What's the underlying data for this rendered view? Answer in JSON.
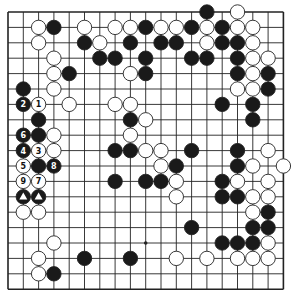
{
  "board": {
    "size": 19,
    "origin_x": 8,
    "origin_y": 12,
    "spacing_x": 15.3,
    "spacing_y": 15.4,
    "stone_radius": 7.2,
    "colors": {
      "black": "#1a1a1a",
      "white": "#ffffff",
      "line": "#222222",
      "stroke": "#222222"
    },
    "star_points": [
      {
        "col": 9,
        "row": 15
      }
    ]
  },
  "stones": [
    {
      "col": 13,
      "row": 0,
      "color": "black"
    },
    {
      "col": 15,
      "row": 0,
      "color": "white"
    },
    {
      "col": 2,
      "row": 1,
      "color": "white"
    },
    {
      "col": 3,
      "row": 1,
      "color": "black"
    },
    {
      "col": 5,
      "row": 1,
      "color": "white"
    },
    {
      "col": 7,
      "row": 1,
      "color": "white"
    },
    {
      "col": 8,
      "row": 1,
      "color": "white"
    },
    {
      "col": 9,
      "row": 1,
      "color": "black"
    },
    {
      "col": 10,
      "row": 1,
      "color": "white"
    },
    {
      "col": 11,
      "row": 1,
      "color": "white"
    },
    {
      "col": 12,
      "row": 1,
      "color": "black"
    },
    {
      "col": 13,
      "row": 1,
      "color": "white"
    },
    {
      "col": 14,
      "row": 1,
      "color": "black"
    },
    {
      "col": 15,
      "row": 1,
      "color": "white"
    },
    {
      "col": 16,
      "row": 1,
      "color": "white"
    },
    {
      "col": 2,
      "row": 2,
      "color": "white"
    },
    {
      "col": 5,
      "row": 2,
      "color": "black"
    },
    {
      "col": 6,
      "row": 2,
      "color": "white"
    },
    {
      "col": 8,
      "row": 2,
      "color": "black"
    },
    {
      "col": 10,
      "row": 2,
      "color": "black"
    },
    {
      "col": 11,
      "row": 2,
      "color": "black"
    },
    {
      "col": 13,
      "row": 2,
      "color": "white"
    },
    {
      "col": 14,
      "row": 2,
      "color": "black"
    },
    {
      "col": 15,
      "row": 2,
      "color": "black"
    },
    {
      "col": 16,
      "row": 2,
      "color": "white"
    },
    {
      "col": 3,
      "row": 3,
      "color": "white"
    },
    {
      "col": 6,
      "row": 3,
      "color": "black"
    },
    {
      "col": 7,
      "row": 3,
      "color": "black"
    },
    {
      "col": 9,
      "row": 3,
      "color": "black"
    },
    {
      "col": 12,
      "row": 3,
      "color": "black"
    },
    {
      "col": 13,
      "row": 3,
      "color": "black"
    },
    {
      "col": 15,
      "row": 3,
      "color": "black"
    },
    {
      "col": 16,
      "row": 3,
      "color": "white"
    },
    {
      "col": 17,
      "row": 3,
      "color": "white"
    },
    {
      "col": 3,
      "row": 4,
      "color": "white"
    },
    {
      "col": 4,
      "row": 4,
      "color": "black"
    },
    {
      "col": 8,
      "row": 4,
      "color": "white"
    },
    {
      "col": 9,
      "row": 4,
      "color": "black"
    },
    {
      "col": 15,
      "row": 4,
      "color": "black"
    },
    {
      "col": 16,
      "row": 4,
      "color": "white"
    },
    {
      "col": 17,
      "row": 4,
      "color": "black"
    },
    {
      "col": 1,
      "row": 5,
      "color": "black"
    },
    {
      "col": 3,
      "row": 5,
      "color": "white"
    },
    {
      "col": 15,
      "row": 5,
      "color": "white"
    },
    {
      "col": 16,
      "row": 5,
      "color": "white"
    },
    {
      "col": 17,
      "row": 5,
      "color": "black"
    },
    {
      "col": 1,
      "row": 6,
      "color": "black",
      "label": "2"
    },
    {
      "col": 2,
      "row": 6,
      "color": "white",
      "label": "1"
    },
    {
      "col": 4,
      "row": 6,
      "color": "white"
    },
    {
      "col": 7,
      "row": 6,
      "color": "white"
    },
    {
      "col": 8,
      "row": 6,
      "color": "white"
    },
    {
      "col": 14,
      "row": 6,
      "color": "black"
    },
    {
      "col": 16,
      "row": 6,
      "color": "black"
    },
    {
      "col": 2,
      "row": 7,
      "color": "black"
    },
    {
      "col": 8,
      "row": 7,
      "color": "black"
    },
    {
      "col": 9,
      "row": 7,
      "color": "white"
    },
    {
      "col": 16,
      "row": 7,
      "color": "black"
    },
    {
      "col": 1,
      "row": 8,
      "color": "black",
      "label": "6"
    },
    {
      "col": 2,
      "row": 8,
      "color": "black"
    },
    {
      "col": 3,
      "row": 8,
      "color": "white"
    },
    {
      "col": 8,
      "row": 8,
      "color": "white"
    },
    {
      "col": 1,
      "row": 9,
      "color": "black",
      "label": "4"
    },
    {
      "col": 2,
      "row": 9,
      "color": "white",
      "label": "3"
    },
    {
      "col": 3,
      "row": 9,
      "color": "white"
    },
    {
      "col": 7,
      "row": 9,
      "color": "black"
    },
    {
      "col": 8,
      "row": 9,
      "color": "black"
    },
    {
      "col": 9,
      "row": 9,
      "color": "white"
    },
    {
      "col": 10,
      "row": 9,
      "color": "white"
    },
    {
      "col": 12,
      "row": 9,
      "color": "black"
    },
    {
      "col": 15,
      "row": 9,
      "color": "black"
    },
    {
      "col": 17,
      "row": 9,
      "color": "white"
    },
    {
      "col": 1,
      "row": 10,
      "color": "white",
      "label": "5"
    },
    {
      "col": 2,
      "row": 10,
      "color": "black"
    },
    {
      "col": 3,
      "row": 10,
      "color": "black",
      "label": "8"
    },
    {
      "col": 10,
      "row": 10,
      "color": "white"
    },
    {
      "col": 11,
      "row": 10,
      "color": "black"
    },
    {
      "col": 15,
      "row": 10,
      "color": "black"
    },
    {
      "col": 16,
      "row": 10,
      "color": "white"
    },
    {
      "col": 18,
      "row": 10,
      "color": "white"
    },
    {
      "col": 1,
      "row": 11,
      "color": "white",
      "label": "9"
    },
    {
      "col": 2,
      "row": 11,
      "color": "white",
      "label": "7"
    },
    {
      "col": 7,
      "row": 11,
      "color": "black"
    },
    {
      "col": 9,
      "row": 11,
      "color": "black"
    },
    {
      "col": 10,
      "row": 11,
      "color": "black"
    },
    {
      "col": 11,
      "row": 11,
      "color": "white"
    },
    {
      "col": 14,
      "row": 11,
      "color": "black"
    },
    {
      "col": 15,
      "row": 11,
      "color": "white"
    },
    {
      "col": 17,
      "row": 11,
      "color": "white"
    },
    {
      "col": 1,
      "row": 12,
      "color": "black",
      "marker": "triangle"
    },
    {
      "col": 2,
      "row": 12,
      "color": "black",
      "marker": "triangle"
    },
    {
      "col": 11,
      "row": 12,
      "color": "white"
    },
    {
      "col": 14,
      "row": 12,
      "color": "black"
    },
    {
      "col": 15,
      "row": 12,
      "color": "black"
    },
    {
      "col": 16,
      "row": 12,
      "color": "white"
    },
    {
      "col": 17,
      "row": 12,
      "color": "white"
    },
    {
      "col": 1,
      "row": 13,
      "color": "white"
    },
    {
      "col": 2,
      "row": 13,
      "color": "white"
    },
    {
      "col": 16,
      "row": 13,
      "color": "white"
    },
    {
      "col": 17,
      "row": 13,
      "color": "black"
    },
    {
      "col": 12,
      "row": 14,
      "color": "black"
    },
    {
      "col": 16,
      "row": 14,
      "color": "black"
    },
    {
      "col": 17,
      "row": 14,
      "color": "black"
    },
    {
      "col": 3,
      "row": 15,
      "color": "white"
    },
    {
      "col": 14,
      "row": 15,
      "color": "black"
    },
    {
      "col": 15,
      "row": 15,
      "color": "black"
    },
    {
      "col": 16,
      "row": 15,
      "color": "black"
    },
    {
      "col": 17,
      "row": 15,
      "color": "white"
    },
    {
      "col": 2,
      "row": 16,
      "color": "white"
    },
    {
      "col": 5,
      "row": 16,
      "color": "black"
    },
    {
      "col": 8,
      "row": 16,
      "color": "black"
    },
    {
      "col": 11,
      "row": 16,
      "color": "white"
    },
    {
      "col": 13,
      "row": 16,
      "color": "white"
    },
    {
      "col": 15,
      "row": 16,
      "color": "white"
    },
    {
      "col": 16,
      "row": 16,
      "color": "white"
    },
    {
      "col": 17,
      "row": 16,
      "color": "white"
    },
    {
      "col": 2,
      "row": 17,
      "color": "white"
    },
    {
      "col": 3,
      "row": 17,
      "color": "black"
    }
  ]
}
